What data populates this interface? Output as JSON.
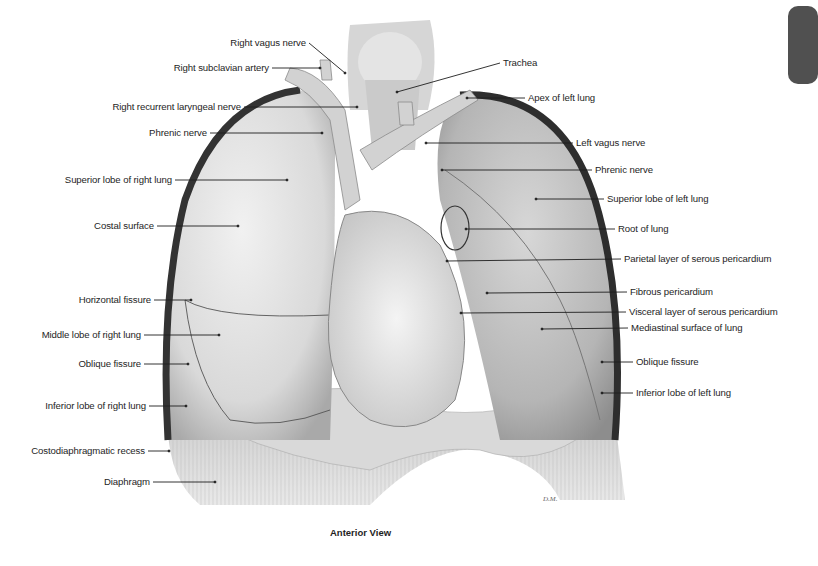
{
  "figure": {
    "caption": "Anterior View",
    "artist_signature": "D.M.",
    "tab_color": "#505050",
    "colors": {
      "lung_light": "#e6e6e6",
      "lung_mid": "#bdbdbd",
      "pleura_dark": "#3a3a3a",
      "heart": "#dcdcdc",
      "diaphragm": "#cfcfcf"
    }
  },
  "labels_left": [
    {
      "id": "right-vagus-nerve",
      "text": "Right vagus nerve",
      "x": 306,
      "y": 43,
      "tx": 345,
      "ty": 73
    },
    {
      "id": "right-subclavian-artery",
      "text": "Right subclavian artery",
      "x": 269,
      "y": 68,
      "tx": 320,
      "ty": 68
    },
    {
      "id": "right-recurrent-laryngeal-nerve",
      "text": "Right recurrent laryngeal nerve",
      "x": 241,
      "y": 107,
      "tx": 357,
      "ty": 107
    },
    {
      "id": "phrenic-nerve-right",
      "text": "Phrenic nerve",
      "x": 207,
      "y": 133,
      "tx": 322,
      "ty": 133
    },
    {
      "id": "superior-lobe-right-lung",
      "text": "Superior lobe of right lung",
      "x": 172,
      "y": 180,
      "tx": 287,
      "ty": 180
    },
    {
      "id": "costal-surface",
      "text": "Costal surface",
      "x": 154,
      "y": 226,
      "tx": 238,
      "ty": 226
    },
    {
      "id": "horizontal-fissure",
      "text": "Horizontal fissure",
      "x": 151,
      "y": 300,
      "tx": 191,
      "ty": 300
    },
    {
      "id": "middle-lobe-right-lung",
      "text": "Middle lobe of right lung",
      "x": 141,
      "y": 335,
      "tx": 219,
      "ty": 335
    },
    {
      "id": "oblique-fissure-right",
      "text": "Oblique fissure",
      "x": 141,
      "y": 364,
      "tx": 188,
      "ty": 364
    },
    {
      "id": "inferior-lobe-right-lung",
      "text": "Inferior lobe of right lung",
      "x": 146,
      "y": 406,
      "tx": 186,
      "ty": 406
    },
    {
      "id": "costodiaphragmatic-recess",
      "text": "Costodiaphragmatic recess",
      "x": 145,
      "y": 451,
      "tx": 169,
      "ty": 451
    },
    {
      "id": "diaphragm",
      "text": "Diaphragm",
      "x": 150,
      "y": 482,
      "tx": 215,
      "ty": 482
    }
  ],
  "labels_right": [
    {
      "id": "trachea",
      "text": "Trachea",
      "x": 503,
      "y": 63,
      "tx": 397,
      "ty": 92
    },
    {
      "id": "apex-left-lung",
      "text": "Apex of left lung",
      "x": 528,
      "y": 98,
      "tx": 467,
      "ty": 98
    },
    {
      "id": "left-vagus-nerve",
      "text": "Left vagus nerve",
      "x": 576,
      "y": 143,
      "tx": 426,
      "ty": 143
    },
    {
      "id": "phrenic-nerve-left",
      "text": "Phrenic nerve",
      "x": 595,
      "y": 170,
      "tx": 442,
      "ty": 170
    },
    {
      "id": "superior-lobe-left-lung",
      "text": "Superior lobe of left lung",
      "x": 607,
      "y": 199,
      "tx": 536,
      "ty": 199
    },
    {
      "id": "root-of-lung",
      "text": "Root of lung",
      "x": 618,
      "y": 229,
      "tx": 466,
      "ty": 229
    },
    {
      "id": "parietal-layer-serous-pericardium",
      "text": "Parietal layer of serous pericardium",
      "x": 624,
      "y": 259,
      "tx": 447,
      "ty": 261
    },
    {
      "id": "fibrous-pericardium",
      "text": "Fibrous pericardium",
      "x": 630,
      "y": 292,
      "tx": 487,
      "ty": 293
    },
    {
      "id": "visceral-layer-serous-pericardium",
      "text": "Visceral  layer of serous pericardium",
      "x": 629,
      "y": 312,
      "tx": 461,
      "ty": 313
    },
    {
      "id": "mediastinal-surface-of-lung",
      "text": "Mediastinal surface of lung",
      "x": 631,
      "y": 328,
      "tx": 542,
      "ty": 329
    },
    {
      "id": "oblique-fissure-left",
      "text": "Oblique fissure",
      "x": 636,
      "y": 362,
      "tx": 602,
      "ty": 362
    },
    {
      "id": "inferior-lobe-left-lung",
      "text": "Inferior lobe of left lung",
      "x": 636,
      "y": 393,
      "tx": 602,
      "ty": 393
    }
  ]
}
